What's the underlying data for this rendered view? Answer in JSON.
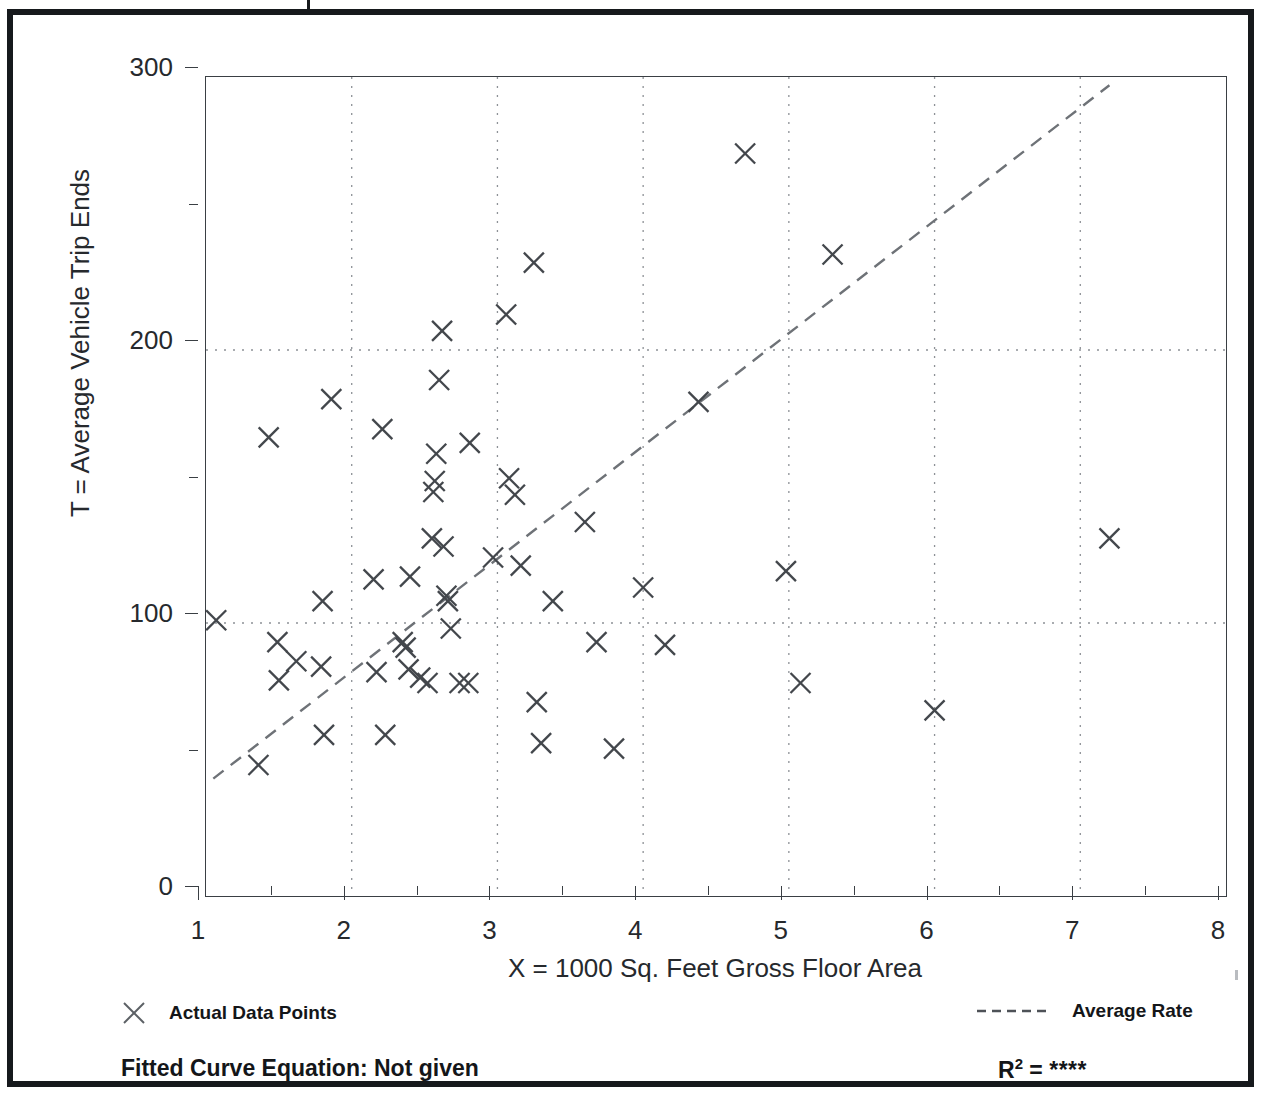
{
  "axes": {
    "y_title": "T = Average Vehicle Trip Ends",
    "x_title": "X = 1000 Sq. Feet Gross Floor Area",
    "y_ticks": [
      "0",
      "100",
      "200",
      "300"
    ],
    "x_ticks": [
      "1",
      "2",
      "3",
      "4",
      "5",
      "6",
      "7",
      "8"
    ]
  },
  "legend": {
    "points_label": "Actual Data Points",
    "rate_label": "Average Rate",
    "points_marker": "x-marker-icon",
    "rate_marker": "dashed-line-icon"
  },
  "footer": {
    "equation_label": "Fitted Curve Equation:  Not given",
    "r2_base": "R",
    "r2_exponent": "2",
    "r2_equals": " = ",
    "r2_value": "****"
  },
  "colors": {
    "frame": "#16191c",
    "axis": "#3a3f44",
    "marker": "#43474c",
    "gridline": "#8d9196",
    "trend": "#6e7277",
    "text": "#26292d"
  },
  "chart_data": {
    "type": "scatter",
    "title": "",
    "xlabel": "X = 1000 Sq. Feet Gross Floor Area",
    "ylabel": "T = Average Vehicle Trip Ends",
    "xlim": [
      1,
      8
    ],
    "ylim": [
      0,
      300
    ],
    "xticks": [
      1,
      2,
      3,
      4,
      5,
      6,
      7,
      8
    ],
    "yticks": [
      0,
      100,
      200,
      300
    ],
    "yminorticks": [
      50,
      150,
      250
    ],
    "grid": "dotted gridlines at y=100 and y=200; dotted vertical gridlines at each integer x",
    "legend_position": "below-axes",
    "series": [
      {
        "name": "Actual Data Points",
        "marker": "x",
        "points": [
          [
            1.07,
            101
          ],
          [
            1.36,
            48
          ],
          [
            1.43,
            168
          ],
          [
            1.49,
            93
          ],
          [
            1.5,
            79
          ],
          [
            1.62,
            86
          ],
          [
            1.79,
            84
          ],
          [
            1.8,
            108
          ],
          [
            1.81,
            59
          ],
          [
            1.86,
            182
          ],
          [
            2.15,
            116
          ],
          [
            2.17,
            82
          ],
          [
            2.21,
            171
          ],
          [
            2.23,
            59
          ],
          [
            2.35,
            93
          ],
          [
            2.37,
            91
          ],
          [
            2.39,
            83
          ],
          [
            2.4,
            117
          ],
          [
            2.47,
            80
          ],
          [
            2.52,
            78
          ],
          [
            2.55,
            131
          ],
          [
            2.56,
            148
          ],
          [
            2.57,
            152
          ],
          [
            2.58,
            162
          ],
          [
            2.6,
            189
          ],
          [
            2.62,
            207
          ],
          [
            2.63,
            128
          ],
          [
            2.65,
            110
          ],
          [
            2.66,
            108
          ],
          [
            2.68,
            98
          ],
          [
            2.74,
            78
          ],
          [
            2.8,
            78
          ],
          [
            2.81,
            166
          ],
          [
            2.97,
            124
          ],
          [
            3.06,
            213
          ],
          [
            3.08,
            153
          ],
          [
            3.12,
            147
          ],
          [
            3.16,
            121
          ],
          [
            3.25,
            232
          ],
          [
            3.27,
            71
          ],
          [
            3.3,
            56
          ],
          [
            3.38,
            108
          ],
          [
            3.6,
            137
          ],
          [
            3.68,
            93
          ],
          [
            3.8,
            54
          ],
          [
            4.0,
            113
          ],
          [
            4.15,
            92
          ],
          [
            4.38,
            181
          ],
          [
            4.7,
            272
          ],
          [
            4.98,
            119
          ],
          [
            5.08,
            78
          ],
          [
            5.3,
            235
          ],
          [
            6.0,
            68
          ],
          [
            7.2,
            131
          ]
        ]
      },
      {
        "name": "Average Rate",
        "style": "dashed-line",
        "endpoints": [
          [
            1.05,
            43
          ],
          [
            7.2,
            297
          ]
        ]
      }
    ]
  }
}
